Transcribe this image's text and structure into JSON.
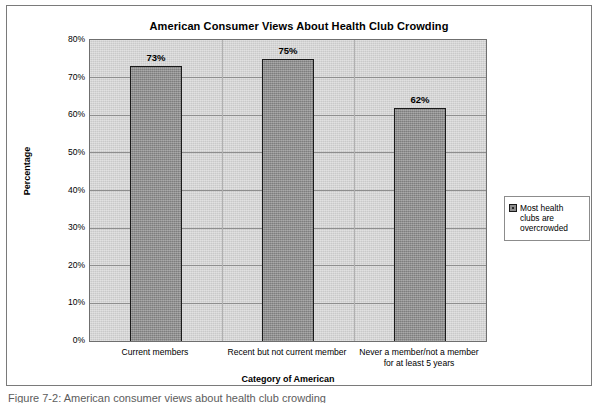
{
  "chart_data": {
    "type": "bar",
    "title": "American Consumer Views About Health Club Crowding",
    "xlabel": "Category of American",
    "ylabel": "Percentage",
    "categories": [
      "Current members",
      "Recent but not current member",
      "Never a member/not a member for at least 5 years"
    ],
    "category_lines": [
      [
        "Current members"
      ],
      [
        "Recent but not current member"
      ],
      [
        "Never a member/not a member",
        "for at least 5 years"
      ]
    ],
    "series": [
      {
        "name": "Most health clubs are overcrowded",
        "values": [
          73,
          75,
          62
        ]
      }
    ],
    "data_labels": [
      "73%",
      "75%",
      "62%"
    ],
    "ylim": [
      0,
      80
    ],
    "ytick_values": [
      0,
      10,
      20,
      30,
      40,
      50,
      60,
      70,
      80
    ],
    "ytick_labels": [
      "0%",
      "10%",
      "20%",
      "30%",
      "40%",
      "50%",
      "60%",
      "70%",
      "80%"
    ],
    "grid": true,
    "legend_position": "right",
    "plot_background_color": "#c9c9c9",
    "bar_color": "#8d8d8d",
    "bar_border_color": "#1a1a1a",
    "gridline_color": "#8e8e8e"
  },
  "legend": {
    "entries": [
      {
        "label": "Most health clubs are overcrowded"
      }
    ]
  },
  "caption": {
    "text": "Figure 7-2: American consumer views about health club crowding"
  }
}
